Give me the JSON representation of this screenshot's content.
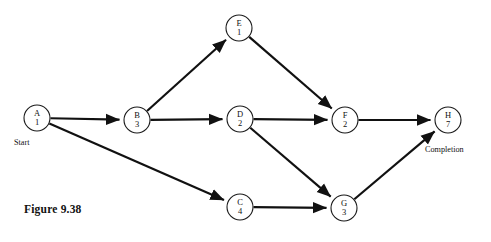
{
  "figure": {
    "caption": "Figure 9.38",
    "start_label": "Start",
    "completion_label": "Completion"
  },
  "diagram_data": {
    "type": "directed-graph",
    "description": "Activity-on-node project network diagram",
    "node_radius": 13,
    "nodes": [
      {
        "id": "A",
        "label": "A",
        "duration": "1",
        "cx": 37,
        "cy": 118
      },
      {
        "id": "B",
        "label": "B",
        "duration": "3",
        "cx": 137,
        "cy": 120
      },
      {
        "id": "E",
        "label": "E",
        "duration": "1",
        "cx": 239,
        "cy": 28
      },
      {
        "id": "D",
        "label": "D",
        "duration": "2",
        "cx": 240,
        "cy": 119
      },
      {
        "id": "C",
        "label": "C",
        "duration": "4",
        "cx": 240,
        "cy": 207
      },
      {
        "id": "F",
        "label": "F",
        "duration": "2",
        "cx": 345,
        "cy": 120
      },
      {
        "id": "G",
        "label": "G",
        "duration": "3",
        "cx": 344,
        "cy": 208
      },
      {
        "id": "H",
        "label": "H",
        "duration": "7",
        "cx": 448,
        "cy": 120
      }
    ],
    "edges": [
      {
        "from": "A",
        "to": "B"
      },
      {
        "from": "A",
        "to": "C"
      },
      {
        "from": "B",
        "to": "E"
      },
      {
        "from": "B",
        "to": "D"
      },
      {
        "from": "E",
        "to": "F"
      },
      {
        "from": "D",
        "to": "F"
      },
      {
        "from": "D",
        "to": "G"
      },
      {
        "from": "C",
        "to": "G"
      },
      {
        "from": "F",
        "to": "H"
      },
      {
        "from": "G",
        "to": "H"
      }
    ],
    "colors": {
      "stroke": "#111111",
      "node_fill": "#ffffff",
      "text": "#111111"
    }
  }
}
